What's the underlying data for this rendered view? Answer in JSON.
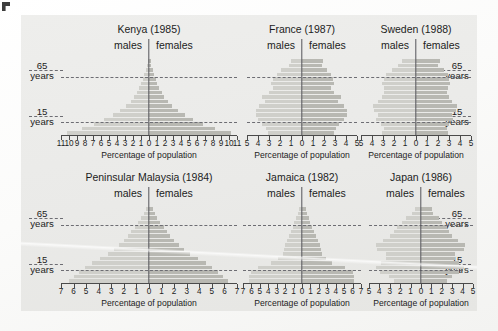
{
  "figure": {
    "axis_title": "Percentage of population",
    "males_label": "males",
    "females_label": "females",
    "age_65_value": "65",
    "age_65_unit": "years",
    "age_15_value": "15",
    "age_15_unit": "years",
    "colors": {
      "panel": "#ececea",
      "male_bar": "#cfcfca",
      "female_bar": "#b8b8b2",
      "center_line": "#55555a",
      "grid_dash": "#6d6d73",
      "text": "#1c1c1c"
    }
  },
  "chart_data": {
    "type": "bar",
    "xlabel": "Percentage of population",
    "ylabel": "Age",
    "grid": "dashed horizontal lines at age 15 and age 65",
    "legend_position": "inline above each panel (males left, females right)",
    "age_bands": [
      "0-4",
      "5-9",
      "10-14",
      "15-19",
      "20-24",
      "25-29",
      "30-34",
      "35-39",
      "40-44",
      "45-49",
      "50-54",
      "55-59",
      "60-64",
      "65-69",
      "70-74",
      "75-79",
      "80+"
    ],
    "panels": [
      {
        "name": "Kenya",
        "year": "1985",
        "title": "Kenya (1985)",
        "xlim": [
          11,
          11
        ],
        "xticks": [
          "11",
          "10",
          "9",
          "8",
          "7",
          "6",
          "5",
          "4",
          "3",
          "2",
          "1",
          "0",
          "1",
          "2",
          "3",
          "4",
          "5",
          "6",
          "7",
          "8",
          "9",
          "10",
          "11"
        ],
        "males": [
          10.3,
          8.4,
          6.9,
          5.6,
          4.5,
          3.6,
          2.9,
          2.3,
          1.9,
          1.5,
          1.2,
          1.0,
          0.8,
          0.6,
          0.4,
          0.25,
          0.15
        ],
        "females": [
          10.2,
          8.3,
          6.8,
          5.5,
          4.5,
          3.6,
          2.9,
          2.4,
          1.9,
          1.6,
          1.3,
          1.0,
          0.85,
          0.65,
          0.45,
          0.3,
          0.2
        ]
      },
      {
        "name": "France",
        "year": "1987",
        "title": "France (1987)",
        "xlim": [
          5,
          5
        ],
        "xticks": [
          "5",
          "4",
          "3",
          "2",
          "1",
          "0",
          "1",
          "2",
          "3",
          "4",
          "5"
        ],
        "males": [
          3.1,
          3.3,
          3.6,
          4.0,
          4.2,
          4.2,
          3.9,
          3.4,
          3.6,
          3.0,
          2.6,
          2.8,
          2.6,
          2.3,
          1.9,
          1.2,
          1.0
        ],
        "females": [
          2.9,
          3.1,
          3.4,
          3.8,
          4.1,
          4.1,
          3.8,
          3.3,
          3.5,
          2.9,
          2.6,
          2.9,
          2.8,
          2.6,
          2.3,
          1.8,
          1.9
        ]
      },
      {
        "name": "Sweden",
        "year": "1988",
        "title": "Sweden (1988)",
        "xlim": [
          5,
          5
        ],
        "xticks": [
          "5",
          "4",
          "3",
          "2",
          "1",
          "0",
          "1",
          "2",
          "3",
          "4",
          "5"
        ],
        "males": [
          3.1,
          2.9,
          3.2,
          3.6,
          3.5,
          3.8,
          3.9,
          3.5,
          3.1,
          2.9,
          2.9,
          3.1,
          2.9,
          2.7,
          2.2,
          1.6,
          1.3
        ],
        "females": [
          2.9,
          2.8,
          3.0,
          3.4,
          3.3,
          3.6,
          3.7,
          3.3,
          3.0,
          2.8,
          2.9,
          3.1,
          3.0,
          2.9,
          2.5,
          2.0,
          2.2
        ]
      },
      {
        "name": "Peninsular Malaysia",
        "year": "1984",
        "title": "Peninsular Malaysia (1984)",
        "xlim": [
          7,
          7
        ],
        "xticks": [
          "7",
          "6",
          "5",
          "4",
          "3",
          "2",
          "1",
          "0",
          "1",
          "2",
          "3",
          "4",
          "5",
          "6",
          "7"
        ],
        "males": [
          6.4,
          6.0,
          5.6,
          5.1,
          4.5,
          3.9,
          3.3,
          2.8,
          2.4,
          2.0,
          1.7,
          1.4,
          1.1,
          0.85,
          0.6,
          0.4,
          0.25
        ],
        "females": [
          6.3,
          5.9,
          5.5,
          5.0,
          4.5,
          3.9,
          3.3,
          2.8,
          2.4,
          2.0,
          1.7,
          1.4,
          1.2,
          0.9,
          0.65,
          0.45,
          0.3
        ]
      },
      {
        "name": "Jamaica",
        "year": "1982",
        "title": "Jamaica (1982)",
        "xlim": [
          7,
          7
        ],
        "xticks": [
          "7",
          "6",
          "5",
          "4",
          "3",
          "2",
          "1",
          "0",
          "1",
          "2",
          "3",
          "4",
          "5",
          "6",
          "7"
        ],
        "males": [
          6.3,
          6.3,
          6.1,
          5.2,
          3.7,
          2.8,
          2.3,
          2.1,
          2.0,
          1.8,
          1.6,
          1.3,
          1.1,
          0.9,
          0.7,
          0.45,
          0.3
        ],
        "females": [
          6.2,
          6.2,
          6.0,
          5.1,
          3.6,
          2.8,
          2.4,
          2.2,
          2.1,
          1.9,
          1.7,
          1.4,
          1.2,
          1.0,
          0.8,
          0.55,
          0.45
        ]
      },
      {
        "name": "Japan",
        "year": "1986",
        "title": "Japan (1986)",
        "xlim": [
          5,
          5
        ],
        "xticks": [
          "5",
          "4",
          "3",
          "2",
          "1",
          "0",
          "1",
          "2",
          "3",
          "4",
          "5"
        ],
        "males": [
          2.6,
          3.1,
          3.9,
          4.3,
          3.8,
          3.4,
          3.4,
          4.2,
          4.3,
          3.7,
          3.0,
          2.6,
          2.3,
          1.8,
          1.4,
          0.9,
          0.6
        ],
        "females": [
          2.5,
          3.0,
          3.7,
          4.1,
          3.7,
          3.3,
          3.3,
          4.1,
          4.2,
          3.6,
          3.0,
          2.7,
          2.5,
          2.0,
          1.7,
          1.2,
          1.1
        ]
      }
    ]
  }
}
